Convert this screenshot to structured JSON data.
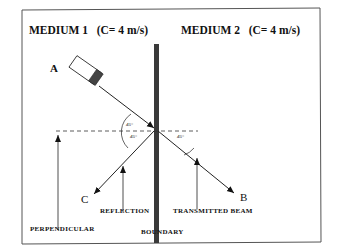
{
  "diagram": {
    "medium1": {
      "name": "MEDIUM  1",
      "speed": "(C= 4 m/s)"
    },
    "medium2": {
      "name": "MEDIUM  2",
      "speed": "(C= 4 m/s)"
    },
    "points": {
      "A": "A",
      "B": "B",
      "C": "C"
    },
    "angles": {
      "incident": "45°",
      "reflected": "45°",
      "transmitted": "45°"
    },
    "labels": {
      "reflection": "REFLECTION",
      "transmitted": "TRANSMITTED  BEAM",
      "perpendicular": "PERPENDICULAR",
      "boundary": "BOUNDARY"
    }
  }
}
